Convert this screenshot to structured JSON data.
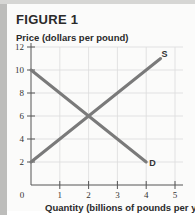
{
  "figure": {
    "title": "FIGURE 1"
  },
  "chart_data": {
    "type": "line",
    "title": "FIGURE 1",
    "xlabel": "Quantity (billions of pounds per year)",
    "ylabel": "Price (dollars per pound)",
    "xlim": [
      0,
      5
    ],
    "ylim": [
      0,
      12
    ],
    "x_ticks": [
      0,
      1,
      2,
      3,
      4,
      5
    ],
    "y_ticks": [
      2,
      4,
      6,
      8,
      10,
      12
    ],
    "x_tick_labels": [
      "0",
      "1",
      "2",
      "3",
      "4",
      "5"
    ],
    "y_tick_labels": [
      "2",
      "4",
      "6",
      "8",
      "10",
      "12"
    ],
    "grid": true,
    "legend": "none (curves labeled inline)",
    "series": [
      {
        "name": "D",
        "label": "D",
        "points": [
          [
            0,
            10
          ],
          [
            4,
            2
          ]
        ]
      },
      {
        "name": "S",
        "label": "S",
        "points": [
          [
            0,
            2
          ],
          [
            4.5,
            11
          ]
        ]
      }
    ],
    "annotations": [
      {
        "text": "S",
        "x": 4.5,
        "y": 11
      },
      {
        "text": "D",
        "x": 4,
        "y": 2
      }
    ]
  },
  "colors": {
    "line": "#7a7a7a",
    "grid": "#dcdcdc",
    "axis": "#555555",
    "background": "#fbfbfa"
  }
}
